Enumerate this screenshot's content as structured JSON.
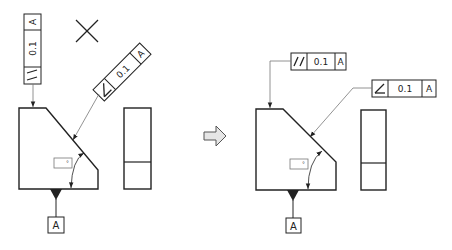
{
  "diagram": {
    "colors": {
      "line": "#222222",
      "leader": "#777777",
      "arrow_fill": "#e6e6e6",
      "arrow_stroke": "#555555",
      "background": "#ffffff"
    },
    "incorrect": {
      "mark": "X",
      "parallelism_frame": {
        "symbol": "//",
        "tolerance": "0.1",
        "datum": "A",
        "orientation": "vertical"
      },
      "angularity_frame": {
        "symbol": "∠",
        "tolerance": "0.1",
        "datum": "A",
        "orientation": "rotated-45"
      },
      "angle_dim_placeholder": "°",
      "datum_label": "A"
    },
    "transition": {
      "icon": "right-arrow"
    },
    "correct": {
      "parallelism_frame": {
        "symbol": "//",
        "tolerance": "0.1",
        "datum": "A",
        "orientation": "horizontal"
      },
      "angularity_frame": {
        "symbol": "∠",
        "tolerance": "0.1",
        "datum": "A",
        "orientation": "horizontal"
      },
      "angle_dim_placeholder": "°",
      "datum_label": "A"
    }
  }
}
